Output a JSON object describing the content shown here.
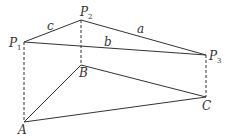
{
  "diagram": {
    "type": "prism-projection",
    "stroke_color": "#333333",
    "points": {
      "P1": {
        "label": "P",
        "sub": "1",
        "x": 24,
        "y": 42
      },
      "P2": {
        "label": "P",
        "sub": "2",
        "x": 81,
        "y": 20
      },
      "P3": {
        "label": "P",
        "sub": "3",
        "x": 206,
        "y": 55
      },
      "A": {
        "label": "A",
        "x": 24,
        "y": 122
      },
      "B": {
        "label": "B",
        "x": 81,
        "y": 65
      },
      "C": {
        "label": "C",
        "x": 206,
        "y": 97
      }
    },
    "edge_labels": {
      "a": "a",
      "b": "b",
      "c": "c"
    },
    "solid_edges": [
      "P1-P2",
      "P2-P3",
      "P1-P3",
      "A-B",
      "B-C",
      "A-C"
    ],
    "dashed_edges": [
      "P1-A",
      "P2-B",
      "P3-C"
    ]
  }
}
